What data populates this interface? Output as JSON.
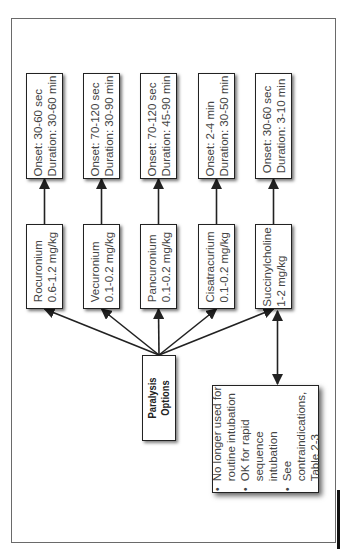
{
  "diagram": {
    "orientation": "rotated-90-ccw",
    "root": {
      "label_lines": [
        "Paralysis",
        "Options"
      ]
    },
    "agents": [
      {
        "name": "Rocuronium",
        "dose": "0.6-1.2 mg/kg",
        "onset": "Onset:  30-60 sec",
        "duration": "Duration:  30-60 min"
      },
      {
        "name": "Vecuronium",
        "dose": "0.1-0.2 mg/kg",
        "onset": "Onset:  70-120 sec",
        "duration": "Duration:  30-90 min"
      },
      {
        "name": "Pancuronium",
        "dose": "0.1-0.2 mg/kg",
        "onset": "Onset:  70-120 sec",
        "duration": "Duration:  45-90 min"
      },
      {
        "name": "Cisatracurium",
        "dose": "0.1-0.2 mg/kg",
        "onset": "Onset:  2-4 min",
        "duration": "Duration:  30-50 min"
      },
      {
        "name": "Succinylcholine",
        "dose": "1-2 mg/kg",
        "onset": "Onset:  30-60 sec",
        "duration": "Duration:  3-10 min"
      }
    ],
    "note": {
      "linked_to": "Succinylcholine",
      "bullet": "•",
      "items": [
        [
          "No longer used for",
          "routine intubation"
        ],
        [
          "OK for rapid",
          "sequence",
          "intubation"
        ],
        [
          "See",
          "contraindications,",
          "Table 2-3"
        ]
      ]
    }
  }
}
